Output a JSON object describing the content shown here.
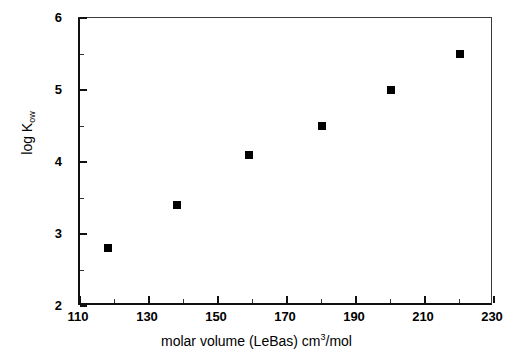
{
  "chart_data": {
    "type": "scatter",
    "title": "",
    "xlabel": "molar volume (LeBas) cm³/mol",
    "xlabel_parts": {
      "text_before": "molar volume (LeBas) cm",
      "exponent": "3",
      "text_after": "/mol"
    },
    "ylabel": "log K",
    "ylabel_subscript": "ow",
    "ylabel_full": "log Kow",
    "xlim": [
      110,
      230
    ],
    "ylim": [
      2,
      6
    ],
    "x_major_ticks": [
      110,
      130,
      150,
      170,
      190,
      210,
      230
    ],
    "x_minor_interval": 10,
    "y_major_ticks": [
      2,
      3,
      4,
      5,
      6
    ],
    "y_minor_interval": 0.5,
    "x_tick_labels": [
      "110",
      "130",
      "150",
      "170",
      "190",
      "210",
      "230"
    ],
    "y_tick_labels": [
      "2",
      "3",
      "4",
      "5",
      "6"
    ],
    "grid": false,
    "legend": null,
    "marker": "filled-square",
    "marker_color": "#000000",
    "axis_color": "#111111",
    "background_color": "#ffffff",
    "x": [
      118,
      138,
      159,
      180,
      200,
      220
    ],
    "y": [
      2.8,
      3.4,
      4.1,
      4.5,
      5.0,
      5.5
    ],
    "points": [
      {
        "x": 118,
        "y": 2.8
      },
      {
        "x": 138,
        "y": 3.4
      },
      {
        "x": 159,
        "y": 4.1
      },
      {
        "x": 180,
        "y": 4.5
      },
      {
        "x": 200,
        "y": 5.0
      },
      {
        "x": 220,
        "y": 5.5
      }
    ]
  }
}
